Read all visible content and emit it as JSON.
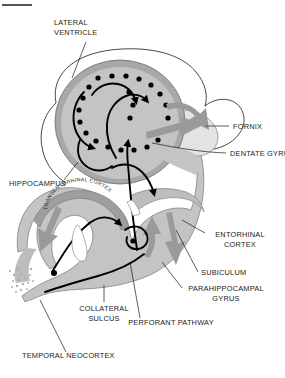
{
  "figure": {
    "top_rule": "horizontal-rule",
    "colors": {
      "background": "#ffffff",
      "tissue_fill": "#c4c4c4",
      "tissue_fill_dark": "#a8a8a8",
      "tissue_outline": "#8c8c8c",
      "ventricle_fill": "#ffffff",
      "fornix_fill": "#e0e0e0",
      "gray_arrow": "#999999",
      "pathway_stroke": "#000000",
      "label_text": "#1a1a1a",
      "leader_line": "#1a1a1a"
    }
  },
  "labels": [
    {
      "id": "lateral-ventricle",
      "line1": "LATERAL",
      "line2": "VENTRICLE",
      "align": "start"
    },
    {
      "id": "fornix",
      "line1": "FORNIX",
      "line2": "",
      "align": "start"
    },
    {
      "id": "dentate-gyrus",
      "line1": "DENTATE GYRUS",
      "line2": "",
      "align": "start"
    },
    {
      "id": "hippocampus",
      "line1": "HIPPOCAMPUS",
      "line2": "",
      "align": "start"
    },
    {
      "id": "entorhinal-cortex",
      "line1": "ENTORHINAL",
      "line2": "CORTEX",
      "align": "middle"
    },
    {
      "id": "subiculum",
      "line1": "SUBICULUM",
      "line2": "",
      "align": "start"
    },
    {
      "id": "parahippocampal-gyrus",
      "line1": "PARAHIPPOCAMPAL",
      "line2": "GYRUS",
      "align": "middle"
    },
    {
      "id": "collateral-sulcus",
      "line1": "COLLATERAL",
      "line2": "SULCUS",
      "align": "middle"
    },
    {
      "id": "perforant-pathway",
      "line1": "PERFORANT PATHWAY",
      "line2": "",
      "align": "middle"
    },
    {
      "id": "temporal-neocortex",
      "line1": "TEMPORAL NEOCORTEX",
      "line2": "",
      "align": "start"
    },
    {
      "id": "transentorhinal-cortex",
      "line1": "TRANSENTORHINAL CORTEX",
      "line2": "",
      "align": "middle"
    }
  ],
  "text": {
    "lateral_ventricle_l1": "LATERAL",
    "lateral_ventricle_l2": "VENTRICLE",
    "fornix": "FORNIX",
    "dentate_gyrus": "DENTATE GYRUS",
    "hippocampus": "HIPPOCAMPUS",
    "entorhinal_cortex_l1": "ENTORHINAL",
    "entorhinal_cortex_l2": "CORTEX",
    "subiculum": "SUBICULUM",
    "parahippocampal_gyrus_l1": "PARAHIPPOCAMPAL",
    "parahippocampal_gyrus_l2": "GYRUS",
    "collateral_sulcus_l1": "COLLATERAL",
    "collateral_sulcus_l2": "SULCUS",
    "perforant_pathway": "PERFORANT PATHWAY",
    "temporal_neocortex": "TEMPORAL NEOCORTEX",
    "transentorhinal_cortex": "TRANSENTORHINAL CORTEX"
  },
  "structures": [
    {
      "id": "lateral-ventricle",
      "kind": "outline-region"
    },
    {
      "id": "hippocampus-body",
      "kind": "filled-region"
    },
    {
      "id": "hippocampus-cross-section",
      "kind": "filled-oval"
    },
    {
      "id": "dentate-gyrus-granule-cells",
      "kind": "dot-array",
      "count": 22
    },
    {
      "id": "fornix",
      "kind": "filled-region"
    },
    {
      "id": "parahippocampal-gyrus",
      "kind": "filled-region"
    },
    {
      "id": "entorhinal-cortex",
      "kind": "filled-region"
    },
    {
      "id": "subiculum",
      "kind": "filled-region"
    },
    {
      "id": "collateral-sulcus",
      "kind": "notch"
    },
    {
      "id": "temporal-neocortex",
      "kind": "stippled-edge"
    }
  ],
  "pathways": [
    {
      "id": "perforant-pathway",
      "style": "black-arrow"
    },
    {
      "id": "mossy-fiber-pathway",
      "style": "black-arrow"
    },
    {
      "id": "schaffer-collateral",
      "style": "black-arrow"
    },
    {
      "id": "fornix-output",
      "style": "gray-arrow"
    },
    {
      "id": "subiculum-output",
      "style": "gray-arrow"
    },
    {
      "id": "neocortex-input",
      "style": "gray-arrow"
    }
  ]
}
